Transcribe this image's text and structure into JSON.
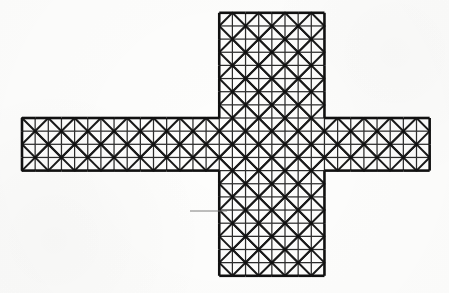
{
  "figure": {
    "name": "cross-shaped-triangulated-grid",
    "canvas": {
      "width": 449,
      "height": 293
    },
    "background_color": "#fdfdfc"
  },
  "style": {
    "outline_color": "#111111",
    "outline_width": 2.6,
    "grid_color": "#2b2b2b",
    "grid_width": 1.25,
    "diagonal_color": "#1a1a1a",
    "diagonal_width": 2.0,
    "node_color": "#111111",
    "node_radius": 1.5,
    "leader_color": "#6f6f6f",
    "leader_width": 0.9
  },
  "geometry": {
    "cell_size": 13.15,
    "origin_x": 22.0,
    "origin_y": 118.0,
    "horizontal_arm": {
      "label": "horizontal-arm",
      "col_start": 0,
      "col_end": 31,
      "row_start": 0,
      "row_end": 4,
      "x_left": 22.0,
      "x_right": 429.65,
      "y_top": 118.0,
      "y_bottom": 170.6
    },
    "vertical_arm": {
      "label": "vertical-arm",
      "col_start": 15,
      "col_end": 23,
      "row_start": -8,
      "row_end": 12,
      "x_left": 219.25,
      "x_right": 324.45,
      "y_top": 12.8,
      "y_bottom": 275.8
    },
    "diagonal_rule": "X-cross bracing placed in 2x2 cell blocks whose shared interior node has (col+row) even parity; each block draws two full-length diagonals through the block centre node",
    "brace_parity": "even"
  },
  "annotation": {
    "leader_line": {
      "label": "leader-line",
      "x1": 190.0,
      "y1": 211.0,
      "x2": 227.0,
      "y2": 211.0
    },
    "caption": ""
  },
  "chart_data": {
    "type": "diagram",
    "title": "",
    "shape": "plus-cross",
    "bays_horizontal": 31,
    "bays_vertical": 20,
    "arm_width_cells": 8,
    "arm_depth_cells": 4,
    "bracing": "alternating X (chevron) diagonals"
  }
}
